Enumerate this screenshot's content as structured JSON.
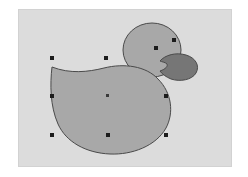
{
  "app": {
    "window_background": "#ffffff",
    "canvas": {
      "background_color": "#dcdcdc",
      "border_color": "#d2d2d2",
      "x": 19,
      "y": 10,
      "width": 212,
      "height": 156
    }
  },
  "artwork": {
    "title": "duck-illustration",
    "shapes": [
      {
        "name": "duck-head",
        "type": "ellipse",
        "fill": "#a8a8a8",
        "stroke": "#4a4a4a",
        "stroke_width": 1,
        "cx": 152,
        "cy": 50,
        "rx": 29,
        "ry": 27
      },
      {
        "name": "duck-beak",
        "type": "path",
        "fill": "#767676",
        "stroke": "#4a4a4a",
        "stroke_width": 1,
        "d": "M 160 61 C 165 55 176 52 186 55 C 196 58 200 66 196 73 C 192 80 180 82 171 79 C 166 77 162 74 160 71 C 166 69 168 66 167 64 C 165 62 162 62 160 61 Z"
      },
      {
        "name": "duck-body",
        "type": "path",
        "fill": "#a8a8a8",
        "stroke": "#4a4a4a",
        "stroke_width": 1,
        "d": "M 52 67 C 70 74 88 72 104 68 C 124 63 146 66 158 79 C 172 93 174 113 166 128 C 156 146 132 155 110 154 C 86 153 66 142 58 124 C 50 106 50 84 52 67 Z"
      }
    ]
  },
  "selection": {
    "name": "selection-handles",
    "handle_color": "#1c1c1c",
    "handle_size": 4,
    "center_handle_color": "#3a3a3a",
    "handles": [
      {
        "name": "handle-top-left",
        "x": 52,
        "y": 68
      },
      {
        "name": "handle-top-center",
        "x": 106,
        "y": 68
      },
      {
        "name": "handle-head-left",
        "x": 156,
        "y": 58
      },
      {
        "name": "handle-head-right",
        "x": 174,
        "y": 50
      },
      {
        "name": "handle-middle-left",
        "x": 52,
        "y": 106
      },
      {
        "name": "handle-middle-right",
        "x": 166,
        "y": 106
      },
      {
        "name": "handle-bottom-left",
        "x": 52,
        "y": 145
      },
      {
        "name": "handle-bottom-center",
        "x": 108,
        "y": 145
      },
      {
        "name": "handle-bottom-right",
        "x": 166,
        "y": 145
      }
    ],
    "center_marker": {
      "name": "rotation-center-marker",
      "x": 108,
      "y": 105
    }
  }
}
